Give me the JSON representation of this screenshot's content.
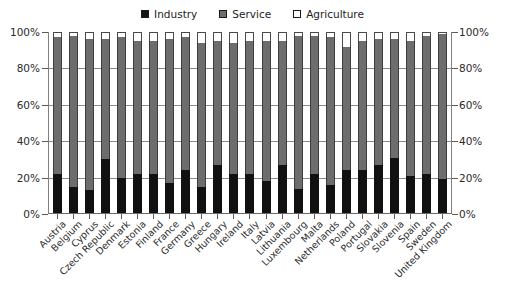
{
  "legend": {
    "position": "top-center",
    "items": [
      {
        "label": "Industry",
        "key": "industry",
        "color": "#141414"
      },
      {
        "label": "Service",
        "key": "service",
        "color": "#6e6e6e"
      },
      {
        "label": "Agriculture",
        "key": "agriculture",
        "color": "#ffffff"
      }
    ]
  },
  "axes": {
    "left": {
      "ticks": [
        "100%",
        "80%",
        "60%",
        "40%",
        "20%",
        "0%"
      ]
    },
    "right": {
      "ticks": [
        "100%",
        "80%",
        "60%",
        "40%",
        "20%",
        "0%"
      ]
    }
  },
  "chart_data": {
    "type": "bar",
    "title": "",
    "subtitle": "",
    "xlabel": "",
    "ylabel": "",
    "ylim": [
      0,
      100
    ],
    "yticks": [
      0,
      20,
      40,
      60,
      80,
      100
    ],
    "grid": true,
    "stacked": true,
    "stack_order": [
      "industry",
      "service",
      "agriculture"
    ],
    "legend_position": "top-center",
    "legend": [
      "Industry",
      "Service",
      "Agriculture"
    ],
    "categories": [
      "Austria",
      "Belgium",
      "Cyprus",
      "Czech Republic",
      "Denmark",
      "Estonia",
      "Finland",
      "France",
      "Germany",
      "Greece",
      "Hungary",
      "Ireland",
      "Italy",
      "Latvia",
      "Lithuania",
      "Luxembourg",
      "Malta",
      "Netherlands",
      "Poland",
      "Portugal",
      "Slovakia",
      "Slovenia",
      "Spain",
      "Sweden",
      "United Kingdom"
    ],
    "series": [
      {
        "name": "Industry",
        "color": "#141414",
        "values": [
          22,
          15,
          13,
          30,
          20,
          22,
          22,
          17,
          24,
          15,
          27,
          22,
          22,
          18,
          27,
          14,
          22,
          16,
          24,
          24,
          27,
          31,
          21,
          22,
          19
        ]
      },
      {
        "name": "Service",
        "color": "#6e6e6e",
        "values": [
          75,
          83,
          83,
          66,
          77,
          73,
          73,
          79,
          73,
          79,
          68,
          72,
          73,
          77,
          68,
          84,
          76,
          81,
          68,
          71,
          69,
          65,
          74,
          76,
          80
        ]
      },
      {
        "name": "Agriculture",
        "color": "#ffffff",
        "values": [
          3,
          2,
          4,
          4,
          3,
          5,
          5,
          4,
          3,
          6,
          5,
          6,
          5,
          5,
          5,
          2,
          2,
          3,
          8,
          5,
          4,
          4,
          5,
          2,
          1
        ]
      }
    ]
  }
}
